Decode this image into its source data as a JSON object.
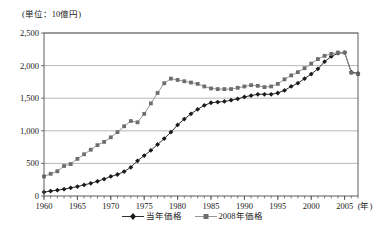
{
  "unit_label": "(単位：10億円)",
  "axis": {
    "x_unit": "(年)",
    "y_ticks": [
      "0",
      "500",
      "1,000",
      "1,500",
      "2,000",
      "2,500"
    ],
    "x_ticks": [
      "1960",
      "1965",
      "1970",
      "1975",
      "1980",
      "1985",
      "1990",
      "1995",
      "2000",
      "2005"
    ]
  },
  "legend": {
    "items": [
      {
        "label": "当年価格",
        "marker": "diamond",
        "color": "#1a1a1a"
      },
      {
        "label": "2008年価格",
        "marker": "square",
        "color": "#8c8c8c"
      }
    ]
  },
  "colors": {
    "series_current": "#1a1a1a",
    "series_constant": "#8c8c8c",
    "grid": "#a6a6a6",
    "frame": "#4d4d4d"
  },
  "chart_data": {
    "type": "line",
    "title": "",
    "subtitle": "",
    "xlabel": "(年)",
    "ylabel": "(単位：10億円)",
    "xlim": [
      1960,
      2007
    ],
    "ylim": [
      0,
      2500
    ],
    "ytick_values": [
      0,
      500,
      1000,
      1500,
      2000,
      2500
    ],
    "xtick_values": [
      1960,
      1965,
      1970,
      1975,
      1980,
      1985,
      1990,
      1995,
      2000,
      2005
    ],
    "grid": "horizontal",
    "legend_position": "bottom-center",
    "x": [
      1960,
      1961,
      1962,
      1963,
      1964,
      1965,
      1966,
      1967,
      1968,
      1969,
      1970,
      1971,
      1972,
      1973,
      1974,
      1975,
      1976,
      1977,
      1978,
      1979,
      1980,
      1981,
      1982,
      1983,
      1984,
      1985,
      1986,
      1987,
      1988,
      1989,
      1990,
      1991,
      1992,
      1993,
      1994,
      1995,
      1996,
      1997,
      1998,
      1999,
      2000,
      2001,
      2002,
      2003,
      2004,
      2005,
      2006,
      2007
    ],
    "series": [
      {
        "name": "当年価格",
        "marker": "diamond",
        "color": "#1a1a1a",
        "values": [
          60,
          75,
          90,
          105,
          125,
          145,
          170,
          195,
          225,
          260,
          300,
          330,
          375,
          440,
          540,
          620,
          700,
          790,
          880,
          980,
          1090,
          1180,
          1260,
          1330,
          1390,
          1430,
          1440,
          1450,
          1470,
          1490,
          1520,
          1540,
          1560,
          1560,
          1560,
          1580,
          1620,
          1680,
          1730,
          1800,
          1870,
          1950,
          2060,
          2140,
          2190,
          2200,
          1900,
          1880
        ]
      },
      {
        "name": "2008年価格",
        "marker": "square",
        "color": "#8c8c8c",
        "values": [
          300,
          340,
          380,
          460,
          490,
          570,
          640,
          710,
          780,
          830,
          900,
          980,
          1070,
          1150,
          1130,
          1260,
          1420,
          1580,
          1730,
          1800,
          1780,
          1760,
          1740,
          1720,
          1680,
          1650,
          1640,
          1640,
          1640,
          1660,
          1680,
          1700,
          1690,
          1670,
          1680,
          1720,
          1790,
          1850,
          1900,
          1960,
          2030,
          2100,
          2150,
          2180,
          2200,
          2200,
          1890,
          1870
        ]
      }
    ]
  }
}
